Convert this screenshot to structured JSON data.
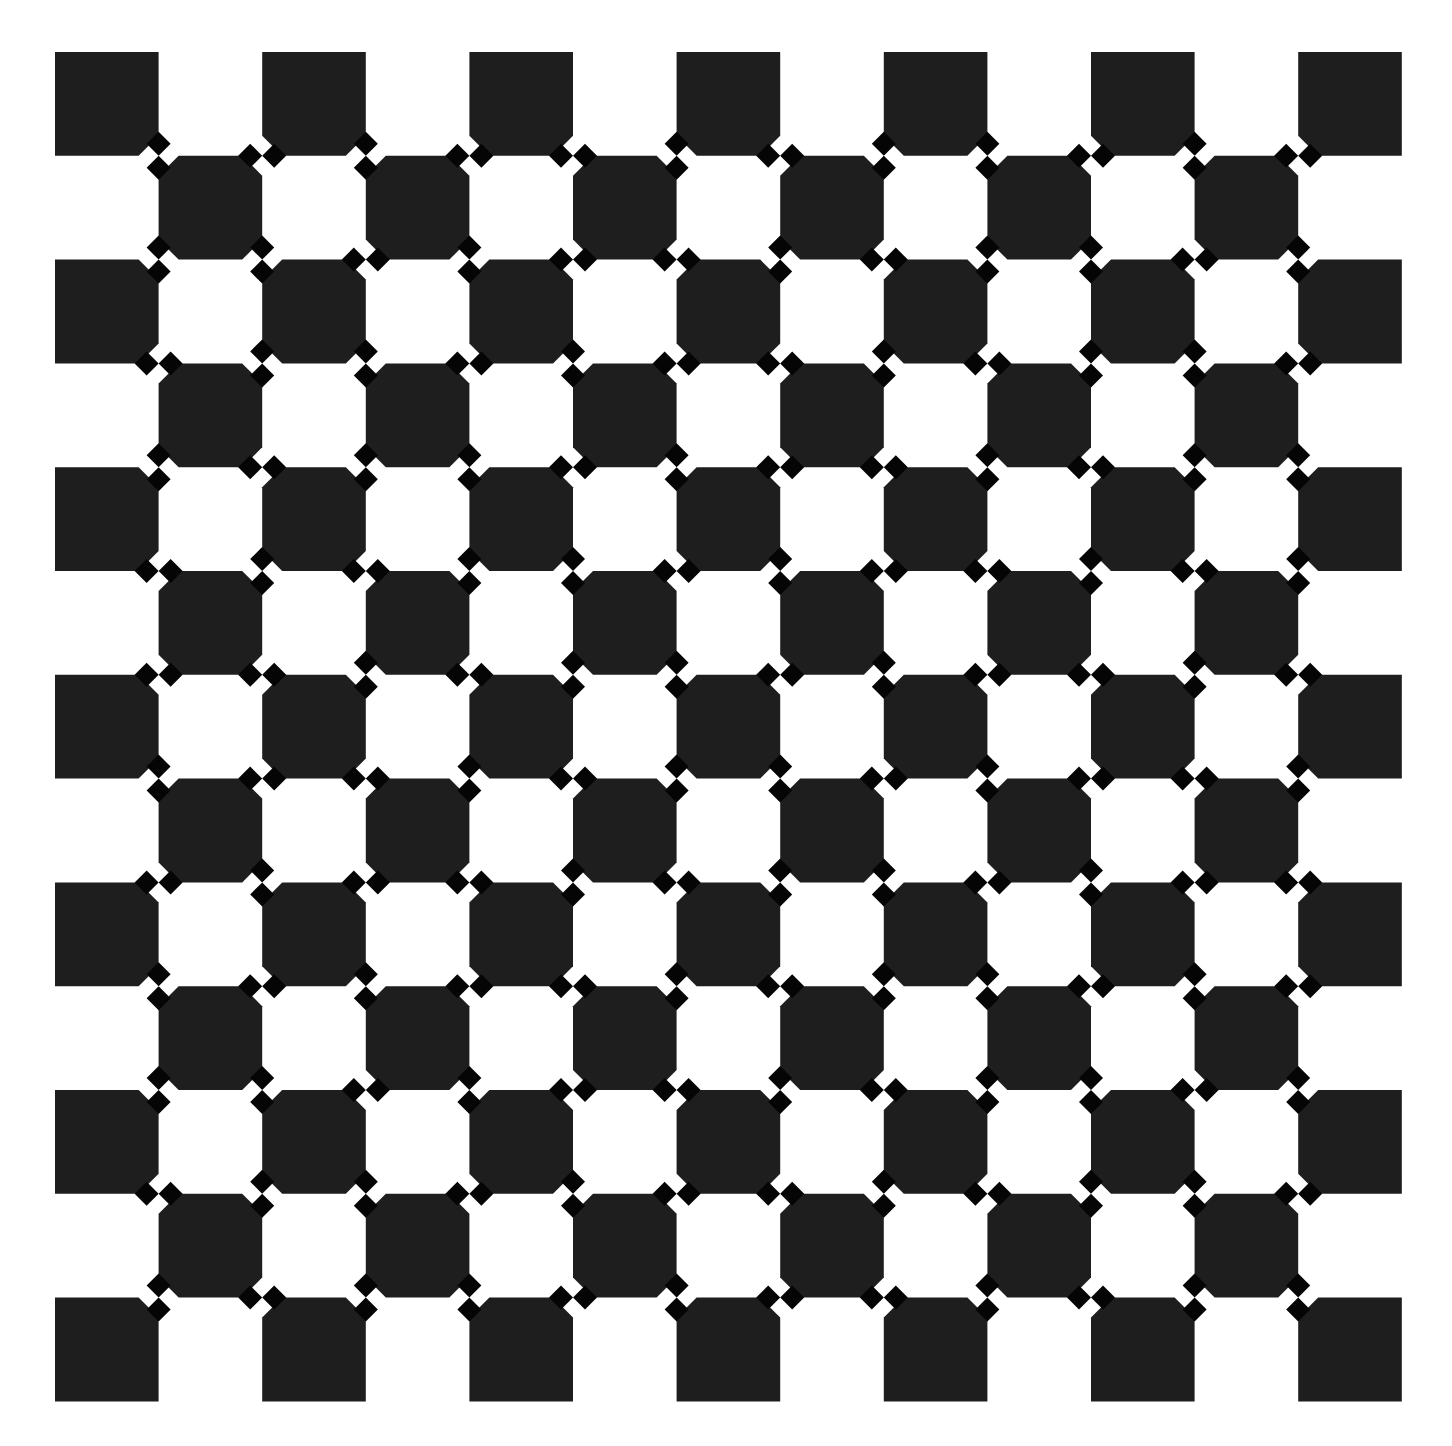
{
  "figure": {
    "type": "checkerboard-bulge-illusion",
    "background": "#ffffff",
    "square_color": "#1e1e1e",
    "diamond_color": "#050505",
    "grid": {
      "cols": 13,
      "rows": 13,
      "origin_x": 55,
      "origin_y": 52,
      "cell_w": 103.6,
      "cell_h": 103.8,
      "black_parity": "even"
    },
    "corner_bevel": 20,
    "diamond": {
      "half_diagonal": 12,
      "offset_from_vertex": 12
    },
    "vertex_orientation_legend": {
      "v": "pair of diamonds on vertical edge (above and below vertex)",
      "h": "pair of diamonds on horizontal edge (left and right of vertex)"
    },
    "vertex_orientation_rows": [
      "vhvhhvhvvhvh",
      "vvhvhhvhvvhv",
      "hvvhvhhvhvvh",
      "vhvvhvhhvhvv",
      "hvhvvhvhhvhv",
      "hhvhvvhvhhvh",
      "vhhvhvvhvhhv",
      "hvhhvhvvhvhh",
      "vhvhhvhvvhvh",
      "vvhvhhvhvvhv",
      "hvvhvhhvhvvh",
      "vhvvhvhhvhvv"
    ]
  }
}
